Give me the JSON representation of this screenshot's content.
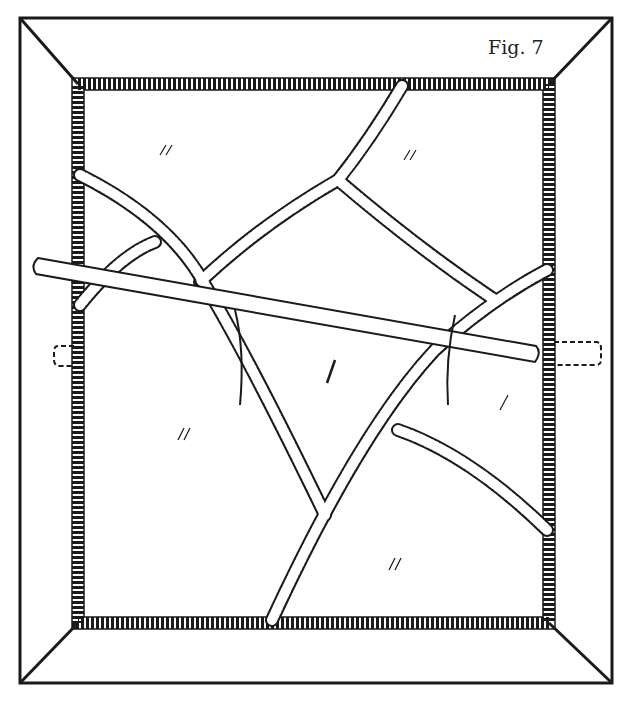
{
  "figure": {
    "label": "Fig. 7"
  },
  "colors": {
    "ink": "#1a1a1a",
    "paper": "#ffffff"
  },
  "elements": [
    "outer-frame",
    "inner-frame",
    "lead-came-strips",
    "glass-panes",
    "rod",
    "tie-wires",
    "dashed-tabs"
  ]
}
